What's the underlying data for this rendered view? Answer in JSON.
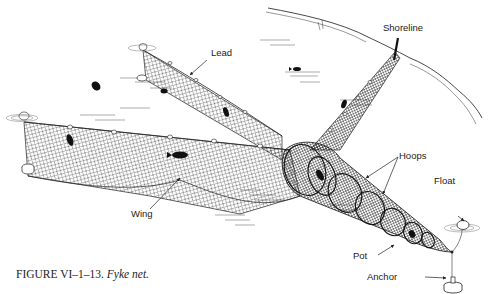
{
  "labels": {
    "lead": "Lead",
    "shoreline": "Shoreline",
    "hoops": "Hoops",
    "float": "Float",
    "wing": "Wing",
    "pot": "Pot",
    "anchor": "Anchor"
  },
  "caption": {
    "number": "FIGURE VI–1–13.",
    "title": "Fyke net."
  },
  "colors": {
    "ink": "#1a1a1a",
    "background": "#ffffff"
  }
}
